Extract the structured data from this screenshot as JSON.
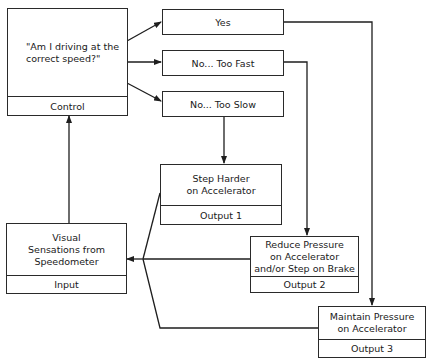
{
  "control": {
    "question_line1": "\"Am I driving at the",
    "question_line2": "correct speed?\"",
    "label": "Control"
  },
  "decisions": [
    {
      "label": "Yes"
    },
    {
      "label": "No... Too Fast"
    },
    {
      "label": "No... Too Slow"
    }
  ],
  "outputs": [
    {
      "line1": "Step Harder",
      "line2": "on Accelerator",
      "line3": "",
      "label": "Output 1"
    },
    {
      "line1": "Reduce Pressure",
      "line2": "on Accelerator",
      "line3": "and/or Step on Brake",
      "label": "Output 2"
    },
    {
      "line1": "Maintain Pressure",
      "line2": "on Accelerator",
      "line3": "",
      "label": "Output 3"
    }
  ],
  "input": {
    "line1": "Visual",
    "line2": "Sensations from",
    "line3": "Speedometer",
    "label": "Input"
  },
  "colors": {
    "line": "#1e1e1e",
    "background": "#ffffff"
  }
}
